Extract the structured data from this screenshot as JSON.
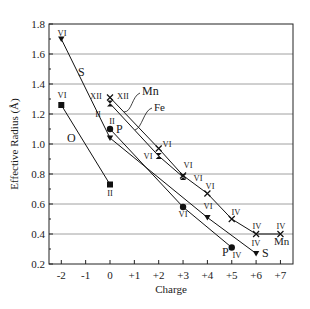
{
  "chart_data": {
    "type": "line",
    "title": "",
    "xlabel": "Charge",
    "ylabel": "Effective Radius (Å)",
    "xlim": [
      -2.5,
      7.5
    ],
    "ylim": [
      0.2,
      1.8
    ],
    "x_ticks": [
      "-2",
      "-1",
      "0",
      "+1",
      "+2",
      "+3",
      "+4",
      "+5",
      "+6",
      "+7"
    ],
    "x_tick_values": [
      -2,
      -1,
      0,
      1,
      2,
      3,
      4,
      5,
      6,
      7
    ],
    "y_ticks": [
      "0.2",
      "0.4",
      "0.6",
      "0.8",
      "1.0",
      "1.2",
      "1.4",
      "1.6",
      "1.8"
    ],
    "y_tick_values": [
      0.2,
      0.4,
      0.6,
      0.8,
      1.0,
      1.2,
      1.4,
      1.6,
      1.8
    ],
    "grid": "horizontal",
    "series": [
      {
        "name": "S",
        "marker": "triangle-down",
        "points": [
          {
            "x": -2,
            "y": 1.7,
            "cn": "VI"
          },
          {
            "x": 0,
            "y": 1.04,
            "cn": "II"
          },
          {
            "x": 4,
            "y": 0.51,
            "cn": "VI"
          },
          {
            "x": 6,
            "y": 0.27,
            "cn": "IV"
          }
        ]
      },
      {
        "name": "O",
        "marker": "square",
        "points": [
          {
            "x": -2,
            "y": 1.26,
            "cn": "VI"
          },
          {
            "x": 0,
            "y": 0.73,
            "cn": "II"
          }
        ]
      },
      {
        "name": "P",
        "marker": "circle",
        "points": [
          {
            "x": 0,
            "y": 1.1,
            "cn": "II"
          },
          {
            "x": 3,
            "y": 0.58,
            "cn": "VI"
          },
          {
            "x": 5,
            "y": 0.31,
            "cn": "IV"
          }
        ]
      },
      {
        "name": "Mn",
        "marker": "x",
        "points": [
          {
            "x": 0,
            "y": 1.31,
            "cn": "XII"
          },
          {
            "x": 2,
            "y": 0.97,
            "cn": "VI"
          },
          {
            "x": 3,
            "y": 0.79,
            "cn": "VI"
          },
          {
            "x": 4,
            "y": 0.67,
            "cn": "VI"
          },
          {
            "x": 5,
            "y": 0.5,
            "cn": "IV"
          },
          {
            "x": 6,
            "y": 0.4,
            "cn": "IV"
          },
          {
            "x": 7,
            "y": 0.4,
            "cn": "IV"
          }
        ]
      },
      {
        "name": "Fe",
        "marker": "hourglass",
        "points": [
          {
            "x": 0,
            "y": 1.27,
            "cn": "XII"
          },
          {
            "x": 2,
            "y": 0.92,
            "cn": "VI"
          },
          {
            "x": 3,
            "y": 0.78,
            "cn": "VI"
          }
        ]
      }
    ],
    "annotations": [
      "S",
      "O",
      "P",
      "Mn",
      "Fe",
      "P",
      "S",
      "Mn"
    ]
  }
}
